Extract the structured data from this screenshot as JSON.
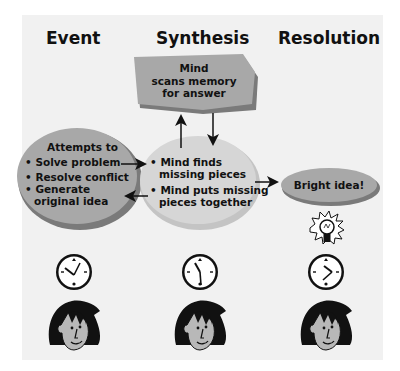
{
  "columns": [
    {
      "heading": "Event"
    },
    {
      "heading": "Synthesis"
    },
    {
      "heading": "Resolution"
    }
  ],
  "memory_box": {
    "lines": [
      "Mind",
      "scans memory",
      "for answer"
    ]
  },
  "event_node": {
    "title": "Attempts to",
    "bullets": [
      "Solve problem",
      "Resolve conflict",
      "Generate",
      "original idea"
    ]
  },
  "synthesis_node": {
    "bullets": [
      "Mind finds",
      "missing pieces",
      "Mind puts missing",
      "pieces together"
    ]
  },
  "resolution_node": {
    "label": "Bright idea!"
  },
  "bullet_char": "•",
  "icons": {
    "lightbulb": "lightbulb-icon",
    "clock": "clock-icon",
    "face": "person-face-icon"
  },
  "colors": {
    "panel": "#f1f1f1",
    "node_fill": "#a8a8a8",
    "node_light": "#d2d2d2",
    "node_edge": "#7a7a7a"
  }
}
